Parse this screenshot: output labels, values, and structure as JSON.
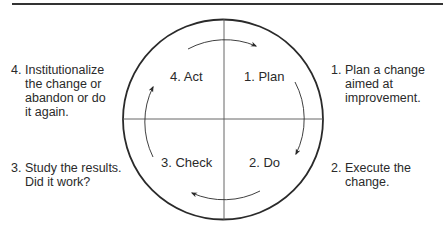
{
  "diagram": {
    "colors": {
      "stroke": "#2a2a2a",
      "text": "#2a2a2a",
      "background": "#ffffff"
    },
    "quadrants": [
      {
        "id": "plan",
        "label": "1. Plan"
      },
      {
        "id": "do",
        "label": "2. Do"
      },
      {
        "id": "check",
        "label": "3. Check"
      },
      {
        "id": "act",
        "label": "4. Act"
      }
    ],
    "notes": [
      {
        "id": "plan",
        "number": "1.",
        "text": "Plan a change\naimed at\nimprovement."
      },
      {
        "id": "do",
        "number": "2.",
        "text": "Execute the\nchange."
      },
      {
        "id": "check",
        "number": "3.",
        "text": "Study the results.\nDid it work?"
      },
      {
        "id": "act",
        "number": "4.",
        "text": "Institutionalize\nthe change or\nabandon or do\nit again."
      }
    ],
    "cycle_direction": "clockwise"
  }
}
